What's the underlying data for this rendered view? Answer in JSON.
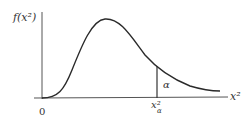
{
  "diagram": {
    "y_axis_label": "f(x²)",
    "x_axis_label": "x²",
    "origin_label": "0",
    "critical_value_label": "x²",
    "critical_value_subscript": "α",
    "tail_area_label": "α",
    "colors": {
      "curve": "#2a2a2a",
      "axes": "#555555",
      "text": "#333333"
    }
  }
}
